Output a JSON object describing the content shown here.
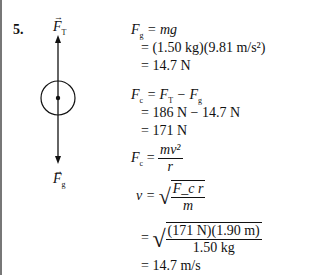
{
  "problem_number": "5.",
  "diagram": {
    "top_label": "F",
    "top_sub": "T",
    "bottom_label": "F",
    "bottom_sub": "g"
  },
  "equations": {
    "fg_lhs": "F",
    "fg_lhs_sub": "g",
    "fg_rhs": " = mg",
    "fg_line2": "= (1.50 kg)(9.81 m/s²)",
    "fg_line3": "= 14.7 N",
    "fc_lhs": "F",
    "fc_lhs_sub": "c",
    "fc_rhs_a": " = F",
    "fc_rhs_a_sub": "T",
    "fc_rhs_b": " − F",
    "fc_rhs_b_sub": "g",
    "fc_line2": "= 186 N − 14.7 N",
    "fc_line3": "= 171 N",
    "fc2_lhs": "F",
    "fc2_lhs_sub": "c",
    "fc2_num": "mv²",
    "fc2_den": "r",
    "v_lhs": "v =",
    "v_num": "F_c r",
    "v_den": "m",
    "v_sub_num": "(171 N)(1.90 m)",
    "v_sub_den": "1.50 kg",
    "v_result": "= 14.7 m/s"
  }
}
